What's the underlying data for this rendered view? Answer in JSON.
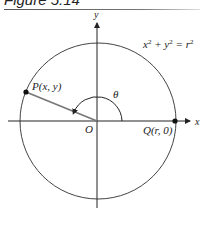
{
  "figure": {
    "title": "Figure 5.14"
  },
  "diagram": {
    "type": "unit-circle-angle",
    "axes": {
      "x_label": "x",
      "y_label": "y"
    },
    "circle": {
      "equation_lhs": "x",
      "equation_mid": " + y",
      "equation_rhs": " = r",
      "exp": "2",
      "equation_text": "x² + y² = r²"
    },
    "origin_label": "O",
    "point_p": {
      "label": "P(x, y)",
      "angle_deg": 158
    },
    "point_q": {
      "label": "Q(r, 0)"
    },
    "angle_label": "θ"
  }
}
